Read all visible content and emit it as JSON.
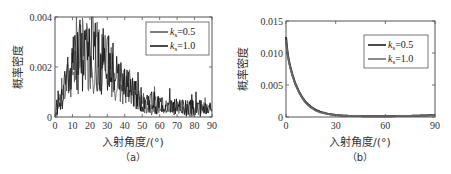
{
  "chart_data": [
    {
      "id": "a",
      "type": "line",
      "caption": "（a）",
      "xlabel": "入射角度/(°)",
      "ylabel": "概率密度",
      "xlim": [
        0,
        90
      ],
      "ylim": [
        0,
        0.004
      ],
      "xticks": [
        0,
        10,
        20,
        30,
        40,
        50,
        60,
        70,
        80,
        90
      ],
      "yticks": [
        0,
        0.002,
        0.004
      ],
      "ytick_labels": [
        "0",
        "0.002",
        "0.004"
      ],
      "grid": false,
      "legend_position": "upper right",
      "x": [
        0,
        2,
        4,
        6,
        8,
        10,
        12,
        14,
        16,
        18,
        20,
        22,
        24,
        26,
        28,
        30,
        32,
        34,
        36,
        38,
        40,
        42,
        44,
        46,
        48,
        50,
        55,
        60,
        65,
        70,
        75,
        80,
        85,
        90
      ],
      "series": [
        {
          "name": "k_s=0.5",
          "label_main": "k",
          "label_sub": "s",
          "label_value": "=0.5",
          "color": "#555555",
          "values": [
            0.0,
            0.0006,
            0.0009,
            0.0012,
            0.0015,
            0.0018,
            0.0021,
            0.0023,
            0.0025,
            0.0026,
            0.0025,
            0.0024,
            0.0025,
            0.0023,
            0.0021,
            0.002,
            0.0019,
            0.0017,
            0.0015,
            0.0013,
            0.0012,
            0.001,
            0.0009,
            0.0008,
            0.0007,
            0.0006,
            0.0005,
            0.00045,
            0.0004,
            0.0004,
            0.00035,
            0.00035,
            0.0003,
            0.0003
          ]
        },
        {
          "name": "k_s=1.0",
          "label_main": "k",
          "label_sub": "s",
          "label_value": "=1.0",
          "color": "#111111",
          "values": [
            0.0,
            0.0007,
            0.001,
            0.0013,
            0.0016,
            0.0019,
            0.0022,
            0.0024,
            0.0026,
            0.0027,
            0.0026,
            0.0025,
            0.0026,
            0.0024,
            0.0022,
            0.0021,
            0.0019,
            0.0018,
            0.0016,
            0.0014,
            0.0012,
            0.0011,
            0.001,
            0.0009,
            0.0008,
            0.0007,
            0.0006,
            0.0005,
            0.00045,
            0.0004,
            0.0004,
            0.00035,
            0.00035,
            0.00035
          ]
        }
      ],
      "spikes_max": 0.004
    },
    {
      "id": "b",
      "type": "line",
      "caption": "（b）",
      "xlabel": "入射角度/(°)",
      "ylabel": "概率密度",
      "xlim": [
        0,
        90
      ],
      "ylim": [
        0,
        0.015
      ],
      "xticks": [
        0,
        30,
        60,
        90
      ],
      "yticks": [
        0,
        0.005,
        0.01,
        0.015
      ],
      "ytick_labels": [
        "0",
        "0.005",
        "0.010",
        "0.015"
      ],
      "grid": false,
      "legend_position": "upper right",
      "x": [
        0,
        1,
        2,
        3,
        4,
        5,
        6,
        8,
        10,
        12,
        15,
        18,
        21,
        25,
        30,
        35,
        40,
        50,
        60,
        70,
        80,
        90
      ],
      "series": [
        {
          "name": "k_s=0.5",
          "label_main": "k",
          "label_sub": "s",
          "label_value": "=0.5",
          "color": "#111111",
          "values": [
            0.0125,
            0.0098,
            0.0085,
            0.0074,
            0.0065,
            0.0057,
            0.005,
            0.0039,
            0.003,
            0.0023,
            0.0016,
            0.0011,
            0.0008,
            0.0005,
            0.0003,
            0.0002,
            0.00015,
            0.00012,
            0.00012,
            0.00015,
            0.0002,
            0.0003
          ]
        },
        {
          "name": "k_s=1.0",
          "label_main": "k",
          "label_sub": "s",
          "label_value": "=1.0",
          "color": "#666666",
          "values": [
            0.012,
            0.0096,
            0.0084,
            0.0073,
            0.0064,
            0.0056,
            0.0049,
            0.0038,
            0.0029,
            0.0022,
            0.0015,
            0.001,
            0.0007,
            0.0005,
            0.0003,
            0.0002,
            0.00015,
            0.00012,
            0.00012,
            0.00014,
            0.0002,
            0.0003
          ]
        }
      ]
    }
  ]
}
